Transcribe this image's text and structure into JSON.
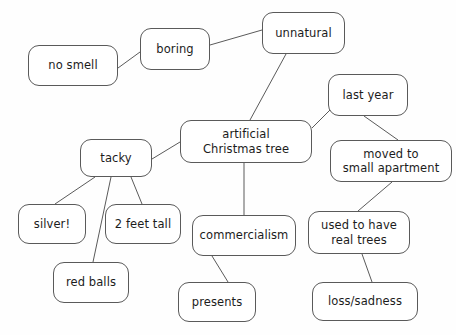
{
  "diagram": {
    "background_color": "#fefefe",
    "node_border_color": "#5a5a5a",
    "node_fill_color": "#ffffff",
    "edge_color": "#5a5a5a",
    "text_color": "#1c1c1c"
  },
  "nodes": [
    {
      "id": "no-smell",
      "label": "no smell",
      "x": 28,
      "y": 45,
      "w": 90,
      "h": 41
    },
    {
      "id": "boring",
      "label": "boring",
      "x": 140,
      "y": 28,
      "w": 70,
      "h": 42
    },
    {
      "id": "unnatural",
      "label": "unnatural",
      "x": 262,
      "y": 12,
      "w": 83,
      "h": 42
    },
    {
      "id": "last-year",
      "label": "last year",
      "x": 328,
      "y": 74,
      "w": 80,
      "h": 42
    },
    {
      "id": "artificial-tree",
      "label": "artificial\nChristmas tree",
      "x": 180,
      "y": 120,
      "w": 132,
      "h": 43
    },
    {
      "id": "moved-apartment",
      "label": "moved to\nsmall apartment",
      "x": 330,
      "y": 140,
      "w": 122,
      "h": 42
    },
    {
      "id": "tacky",
      "label": "tacky",
      "x": 80,
      "y": 139,
      "w": 72,
      "h": 38
    },
    {
      "id": "silver",
      "label": "silver!",
      "x": 18,
      "y": 204,
      "w": 68,
      "h": 40
    },
    {
      "id": "two-feet-tall",
      "label": "2 feet tall",
      "x": 105,
      "y": 204,
      "w": 76,
      "h": 40
    },
    {
      "id": "commercialism",
      "label": "commercialism",
      "x": 192,
      "y": 215,
      "w": 104,
      "h": 41
    },
    {
      "id": "used-to-have",
      "label": "used to have\nreal trees",
      "x": 308,
      "y": 211,
      "w": 102,
      "h": 43
    },
    {
      "id": "red-balls",
      "label": "red balls",
      "x": 53,
      "y": 262,
      "w": 76,
      "h": 41
    },
    {
      "id": "presents",
      "label": "presents",
      "x": 178,
      "y": 282,
      "w": 78,
      "h": 40
    },
    {
      "id": "loss-sadness",
      "label": "loss/sadness",
      "x": 312,
      "y": 282,
      "w": 106,
      "h": 39
    }
  ],
  "edges": [
    {
      "id": "edge-no-smell-boring",
      "from": "no-smell",
      "to": "boring",
      "x1": 118,
      "y1": 68,
      "x2": 140,
      "y2": 52
    },
    {
      "id": "edge-boring-unnatural",
      "from": "boring",
      "to": "unnatural",
      "x1": 210,
      "y1": 45,
      "x2": 262,
      "y2": 30
    },
    {
      "id": "edge-unnatural-artificial-tree",
      "from": "unnatural",
      "to": "artificial-tree",
      "x1": 286,
      "y1": 54,
      "x2": 250,
      "y2": 120
    },
    {
      "id": "edge-artificial-tree-last-year",
      "from": "artificial-tree",
      "to": "last-year",
      "x1": 312,
      "y1": 128,
      "x2": 330,
      "y2": 110
    },
    {
      "id": "edge-last-year-moved-apartment",
      "from": "last-year",
      "to": "moved-apartment",
      "x1": 364,
      "y1": 116,
      "x2": 398,
      "y2": 140
    },
    {
      "id": "edge-artificial-tree-tacky",
      "from": "artificial-tree",
      "to": "tacky",
      "x1": 180,
      "y1": 142,
      "x2": 152,
      "y2": 159
    },
    {
      "id": "edge-tacky-silver",
      "from": "tacky",
      "to": "silver",
      "x1": 95,
      "y1": 177,
      "x2": 55,
      "y2": 204
    },
    {
      "id": "edge-tacky-red-balls",
      "from": "tacky",
      "to": "red-balls",
      "x1": 111,
      "y1": 177,
      "x2": 93,
      "y2": 262
    },
    {
      "id": "edge-tacky-two-feet-tall",
      "from": "tacky",
      "to": "two-feet-tall",
      "x1": 131,
      "y1": 177,
      "x2": 142,
      "y2": 204
    },
    {
      "id": "edge-artificial-tree-commercialism",
      "from": "artificial-tree",
      "to": "commercialism",
      "x1": 244,
      "y1": 163,
      "x2": 244,
      "y2": 215
    },
    {
      "id": "edge-commercialism-presents",
      "from": "commercialism",
      "to": "presents",
      "x1": 212,
      "y1": 256,
      "x2": 228,
      "y2": 282
    },
    {
      "id": "edge-moved-apartment-used-to-have",
      "from": "moved-apartment",
      "to": "used-to-have",
      "x1": 392,
      "y1": 182,
      "x2": 358,
      "y2": 211
    },
    {
      "id": "edge-used-to-have-loss-sadness",
      "from": "used-to-have",
      "to": "loss-sadness",
      "x1": 362,
      "y1": 254,
      "x2": 372,
      "y2": 282
    }
  ]
}
